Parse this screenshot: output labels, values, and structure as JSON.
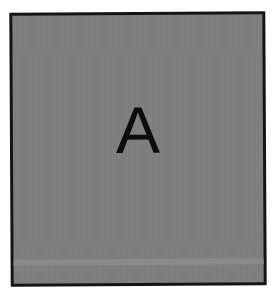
{
  "panel": {
    "letter": "A",
    "fill_color": "#7f7f7f",
    "border_color": "#141414",
    "letter_color": "#0c0c0c"
  }
}
